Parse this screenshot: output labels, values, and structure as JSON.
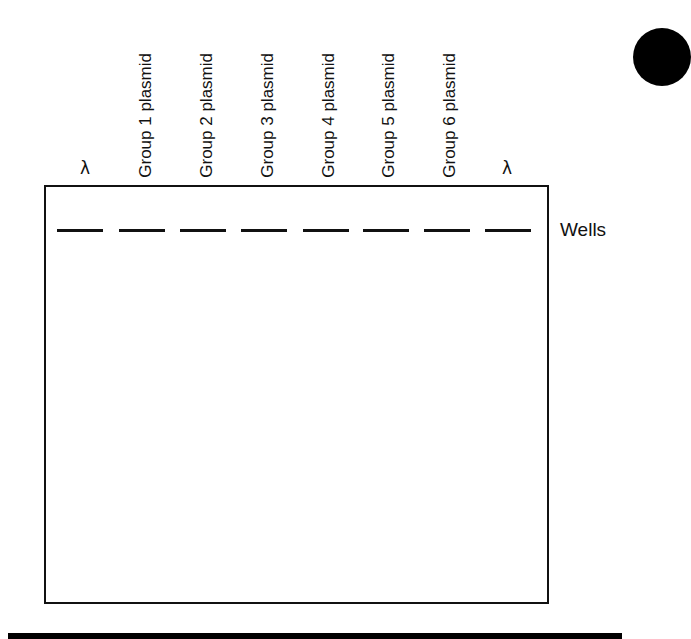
{
  "figure": {
    "type": "agarose gel electrophoresis diagram (blank template)",
    "lanes": [
      {
        "label": "λ",
        "kind": "marker",
        "center_x": 85
      },
      {
        "label": "Group 1 plasmid",
        "kind": "sample",
        "center_x": 145
      },
      {
        "label": "Group 2 plasmid",
        "kind": "sample",
        "center_x": 206
      },
      {
        "label": "Group 3 plasmid",
        "kind": "sample",
        "center_x": 267
      },
      {
        "label": "Group 4 plasmid",
        "kind": "sample",
        "center_x": 328
      },
      {
        "label": "Group 5 plasmid",
        "kind": "sample",
        "center_x": 388
      },
      {
        "label": "Group 6 plasmid",
        "kind": "sample",
        "center_x": 449
      },
      {
        "label": "λ",
        "kind": "marker",
        "center_x": 507
      }
    ],
    "wells_label": "Wells",
    "wells": [
      {
        "left": 57
      },
      {
        "left": 119
      },
      {
        "left": 180
      },
      {
        "left": 241
      },
      {
        "left": 303
      },
      {
        "left": 363
      },
      {
        "left": 424
      },
      {
        "left": 485
      }
    ],
    "colors": {
      "line": "#111111",
      "background": "#ffffff"
    }
  }
}
